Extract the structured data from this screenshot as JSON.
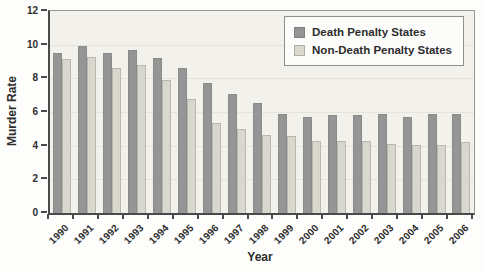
{
  "figure": {
    "x_axis_title": "Year",
    "y_axis_title": "Murder Rate"
  },
  "legend": {
    "position": "top-right",
    "items": [
      {
        "label": "Death Penalty States",
        "color": "#959595"
      },
      {
        "label": "Non-Death Penalty States",
        "color": "#d9d8ce"
      }
    ]
  },
  "chart_data": {
    "type": "bar",
    "title": "",
    "xlabel": "Year",
    "ylabel": "Murder Rate",
    "ylim": [
      0,
      12
    ],
    "yticks": [
      0,
      2,
      4,
      6,
      8,
      10,
      12
    ],
    "grid": true,
    "legend_position": "top-right",
    "categories": [
      "1990",
      "1991",
      "1992",
      "1993",
      "1994",
      "1995",
      "1996",
      "1997",
      "1998",
      "1999",
      "2000",
      "2001",
      "2002",
      "2003",
      "2004",
      "2005",
      "2006"
    ],
    "series": [
      {
        "name": "Death Penalty States",
        "color": "#959595",
        "values": [
          9.5,
          9.94,
          9.51,
          9.69,
          9.23,
          8.59,
          7.72,
          7.09,
          6.51,
          5.86,
          5.7,
          5.82,
          5.82,
          5.91,
          5.71,
          5.87,
          5.9
        ]
      },
      {
        "name": "Non-Death Penalty States",
        "color": "#d9d8ce",
        "values": [
          9.16,
          9.27,
          8.63,
          8.81,
          7.88,
          6.78,
          5.37,
          5.0,
          4.61,
          4.59,
          4.25,
          4.25,
          4.27,
          4.1,
          4.02,
          4.03,
          4.22
        ]
      }
    ],
    "colors": {
      "plot_background": "#f2f1ec",
      "page_background": "#fdfdfc",
      "axis": "#4a4a4a",
      "plot_border": "#979792",
      "text": "#2d2d2d",
      "gridline": "#e4e3dc"
    }
  }
}
